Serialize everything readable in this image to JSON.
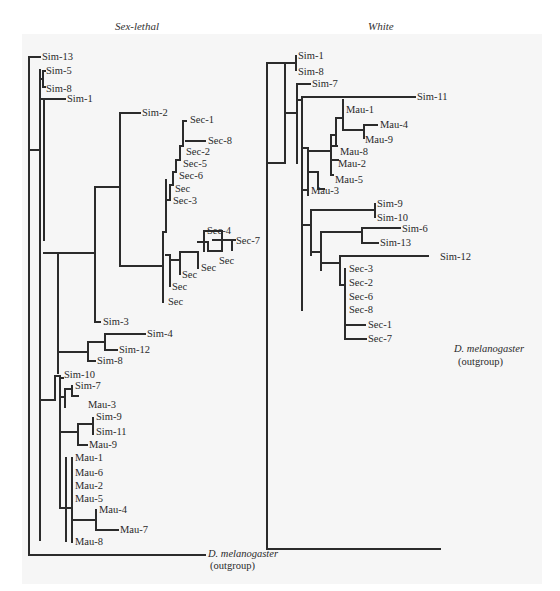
{
  "figure": {
    "trees": [
      {
        "title": "Sex-lethal",
        "leaves": [
          "Sim-13",
          "Sim-5",
          "Sim-8",
          "Sim-1",
          "Sim-2",
          "Sec-1",
          "Sec-8",
          "Sec-2",
          "Sec-5",
          "Sec-6",
          "Sec",
          "Sec-3",
          "Sec-4",
          "Sec-7",
          "Sec",
          "Sec",
          "Sec",
          "Sec",
          "Sec",
          "Sim-3",
          "Sim-4",
          "Sim-12",
          "Sim-8",
          "Sim-10",
          "Sim-7",
          "Mau-3",
          "Sim-9",
          "Sim-11",
          "Mau-9",
          "Mau-1",
          "Mau-6",
          "Mau-2",
          "Mau-5",
          "Mau-4",
          "Mau-7",
          "Mau-8"
        ],
        "outgroup": {
          "name": "D. melanogaster",
          "note": "(outgroup)"
        }
      },
      {
        "title": "White",
        "leaves": [
          "Sim-1",
          "Sim-8",
          "Sim-7",
          "Sim-11",
          "Mau-1",
          "Mau-4",
          "Mau-9",
          "Mau-8",
          "Mau-2",
          "Mau-5",
          "Mau-3",
          "Sim-9",
          "Sim-10",
          "Sim-6",
          "Sim-13",
          "Sim-12",
          "Sec-3",
          "Sec-2",
          "Sec-6",
          "Sec-8",
          "Sec-1",
          "Sec-7"
        ],
        "outgroup": {
          "name": "D. melanogaster",
          "note": "(outgroup)"
        }
      }
    ]
  }
}
